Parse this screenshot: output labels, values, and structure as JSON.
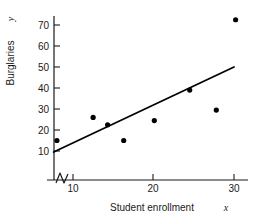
{
  "chart_data": {
    "type": "scatter",
    "title": "",
    "xlabel": "Student enrollment x",
    "xlabel_text": "Student enrollment",
    "xlabel_var": "x",
    "ylabel": "Burglaries y",
    "ylabel_text": "Burglaries",
    "ylabel_var": "y",
    "xlim": [
      7.2,
      31.5
    ],
    "ylim": [
      5,
      76
    ],
    "xticks": [
      10,
      20,
      30
    ],
    "yticks": [
      10,
      20,
      30,
      40,
      50,
      60,
      70
    ],
    "xtick_labels": [
      "10",
      "20",
      "30"
    ],
    "ytick_labels": [
      "10",
      "20",
      "30",
      "40",
      "50",
      "60",
      "70"
    ],
    "grid": false,
    "legend": null,
    "axis_break": {
      "axis": "x",
      "symbol": "zigzag",
      "note": "broken x-axis near origin"
    },
    "points": [
      {
        "x": 8.0,
        "y": 15.0
      },
      {
        "x": 12.5,
        "y": 26.0
      },
      {
        "x": 14.3,
        "y": 22.5
      },
      {
        "x": 16.3,
        "y": 15.0
      },
      {
        "x": 20.1,
        "y": 24.5
      },
      {
        "x": 24.5,
        "y": 39.0
      },
      {
        "x": 27.8,
        "y": 29.5
      },
      {
        "x": 30.2,
        "y": 72.5
      }
    ],
    "fit_line": {
      "type": "linear",
      "x_start": 7.6,
      "y_start": 9.5,
      "x_end": 30.0,
      "y_end": 50.0
    },
    "marker_color": "#000000",
    "line_color": "#000000",
    "axis_color": "#1a1a1a",
    "background_color": "#ffffff"
  }
}
